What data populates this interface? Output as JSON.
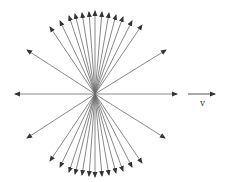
{
  "diagram": {
    "title": "",
    "center": [
      95,
      94
    ],
    "line_color": "#6a6a6a",
    "arrow_color": "#333333",
    "field_lines": [
      [
        50,
        27
      ],
      [
        60,
        21
      ],
      [
        69,
        16
      ],
      [
        75,
        14
      ],
      [
        82,
        13
      ],
      [
        89,
        12
      ],
      [
        95,
        11
      ],
      [
        102,
        12
      ],
      [
        109,
        13
      ],
      [
        116,
        15
      ],
      [
        123,
        17
      ],
      [
        132,
        21
      ],
      [
        142,
        25
      ],
      [
        27,
        50
      ],
      [
        166,
        50
      ],
      [
        15,
        94
      ],
      [
        177,
        94
      ],
      [
        27,
        138
      ],
      [
        165,
        138
      ],
      [
        50,
        161
      ],
      [
        60,
        167
      ],
      [
        69,
        172
      ],
      [
        75,
        174
      ],
      [
        82,
        175
      ],
      [
        89,
        176
      ],
      [
        95,
        177
      ],
      [
        102,
        176
      ],
      [
        109,
        175
      ],
      [
        116,
        173
      ],
      [
        123,
        171
      ],
      [
        132,
        167
      ],
      [
        142,
        163
      ]
    ],
    "velocity_arrow": {
      "from": [
        188,
        94
      ],
      "to": [
        215,
        94
      ]
    },
    "velocity_label": "v"
  }
}
